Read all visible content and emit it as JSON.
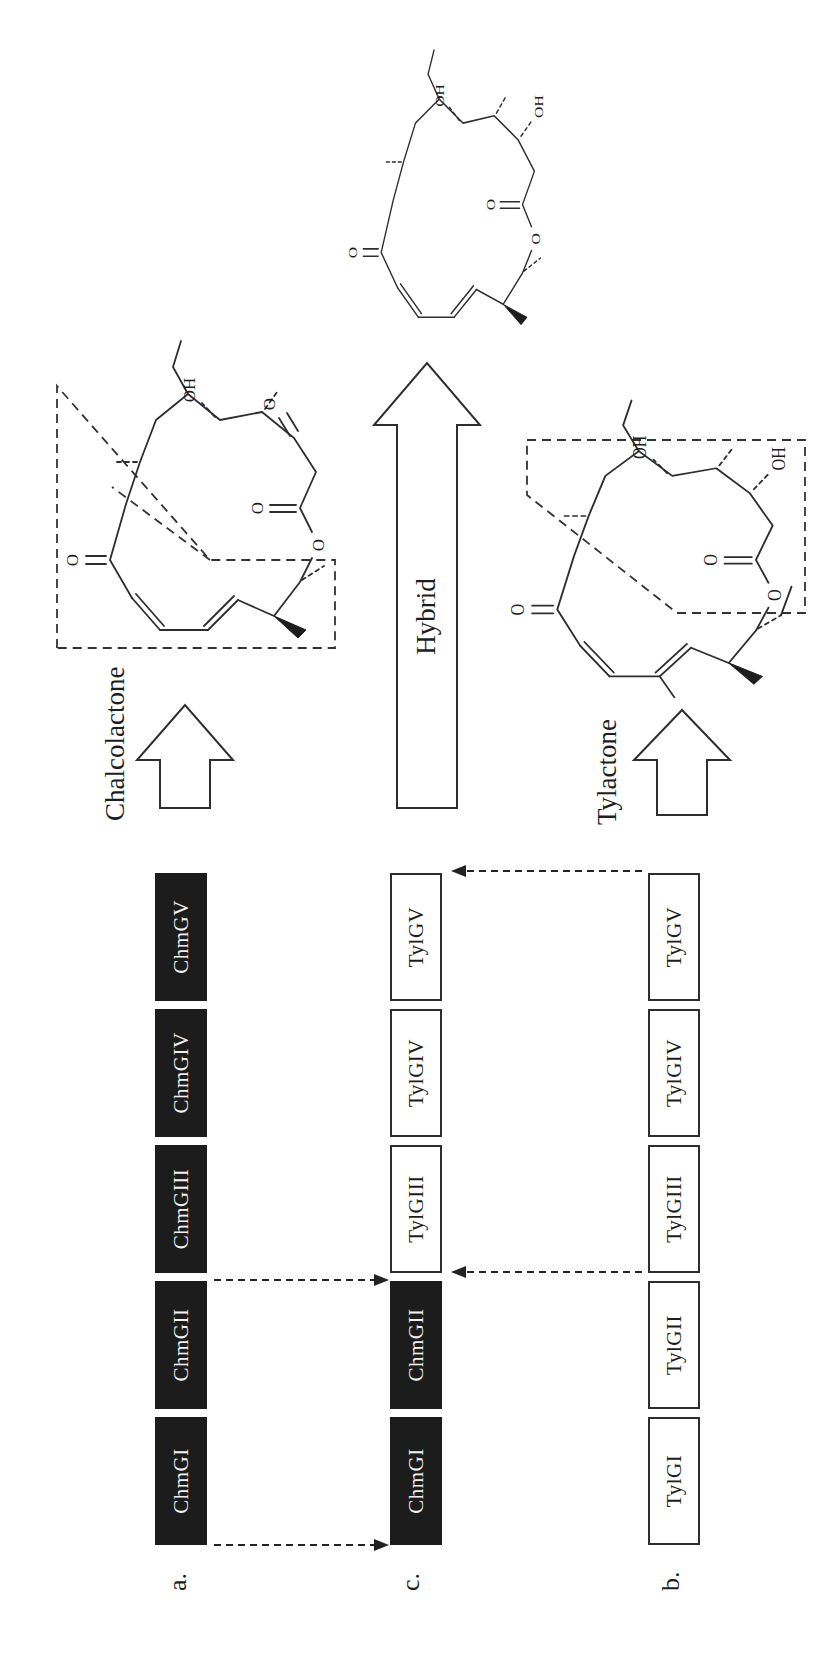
{
  "panels": {
    "a": {
      "label": "a.",
      "genes": [
        {
          "name": "ChmGI",
          "filled": true
        },
        {
          "name": "ChmGII",
          "filled": true
        },
        {
          "name": "ChmGIII",
          "filled": true
        },
        {
          "name": "ChmGIV",
          "filled": true
        },
        {
          "name": "ChmGV",
          "filled": true
        }
      ]
    },
    "c": {
      "label": "c.",
      "genes": [
        {
          "name": "ChmGI",
          "filled": true
        },
        {
          "name": "ChmGII",
          "filled": true
        },
        {
          "name": "TylGIII",
          "filled": false
        },
        {
          "name": "TylGIV",
          "filled": false
        },
        {
          "name": "TylGV",
          "filled": false
        }
      ]
    },
    "b": {
      "label": "b.",
      "genes": [
        {
          "name": "TylGI",
          "filled": false
        },
        {
          "name": "TylGII",
          "filled": false
        },
        {
          "name": "TylGIII",
          "filled": false
        },
        {
          "name": "TylGIV",
          "filled": false
        },
        {
          "name": "TylGV",
          "filled": false
        }
      ]
    }
  },
  "structures": {
    "chalcolactone": {
      "name": "Chalcolactone",
      "atom_labels": {
        "ketone_o": "O",
        "lactone_o": "O",
        "ring_o": "O",
        "c3_o": "O",
        "c5_oh": "OH"
      }
    },
    "hybrid": {
      "name": "Hybrid",
      "atom_labels": {
        "ketone_o": "O",
        "lactone_o": "O",
        "ring_o": "O",
        "c3_oh": "OH",
        "c5_oh": "OH"
      }
    },
    "tylactone": {
      "name": "Tylactone",
      "atom_labels": {
        "ketone_o": "O",
        "lactone_o": "O",
        "ring_o": "O",
        "c3_oh": "OH",
        "c5_oh": "OH"
      }
    }
  },
  "gene_transfers": [
    {
      "from": "a",
      "to": "c",
      "position": "left of ChmGI"
    },
    {
      "from": "a",
      "to": "c",
      "position": "right of ChmGII"
    },
    {
      "from": "b",
      "to": "c",
      "position": "left of TylGIII"
    },
    {
      "from": "b",
      "to": "c",
      "position": "right of TylGV"
    }
  ],
  "colors": {
    "background": "#ffffff",
    "line": "#2e2e2e",
    "gene_filled": "#1c1c1c",
    "gene_empty": "#ffffff"
  }
}
